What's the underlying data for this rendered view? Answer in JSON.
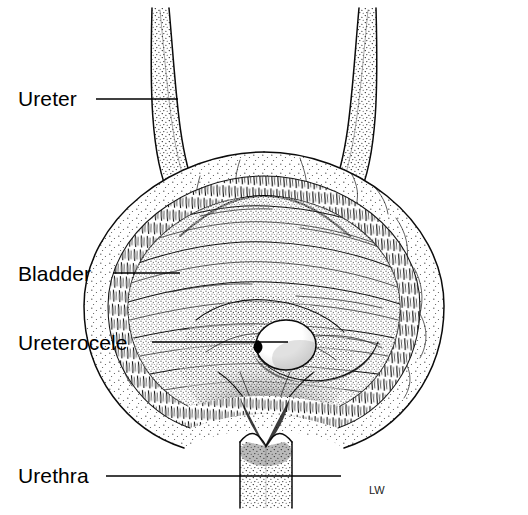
{
  "figure": {
    "kind": "line-drawing-anatomical-illustration",
    "background_color": "#ffffff",
    "ink_color": "#000000",
    "width": 528,
    "height": 515
  },
  "labels": [
    {
      "id": "ureter",
      "text": "Ureter",
      "text_x": 18,
      "text_y": 106,
      "leader": {
        "x1": 96,
        "y1": 99,
        "x2": 178,
        "y2": 99
      }
    },
    {
      "id": "bladder",
      "text": "Bladder",
      "text_x": 18,
      "text_y": 281,
      "leader": {
        "x1": 113,
        "y1": 273,
        "x2": 180,
        "y2": 273
      }
    },
    {
      "id": "ureterocele",
      "text": "Ureterocele",
      "text_x": 18,
      "text_y": 350,
      "leader": {
        "x1": 152,
        "y1": 342,
        "x2": 288,
        "y2": 342
      }
    },
    {
      "id": "urethra",
      "text": "Urethra",
      "text_x": 18,
      "text_y": 483,
      "leader": {
        "x1": 106,
        "y1": 476,
        "x2": 341,
        "y2": 476
      }
    }
  ],
  "structures": [
    {
      "id": "left-ureter",
      "name": "Left ureter",
      "description": "Narrow stippled tube descending from upper left, curving medially to enter the bladder wall"
    },
    {
      "id": "right-ureter",
      "name": "Right ureter",
      "description": "Narrow stippled tube descending from upper right, curving medially to enter the bladder wall"
    },
    {
      "id": "bladder-outer-wall",
      "name": "Bladder outer wall",
      "description": "Stippled serosal / detrusor outer layer forming the rounded bladder silhouette"
    },
    {
      "id": "bladder-muscle-band",
      "name": "Bladder muscular band",
      "description": "Hatched ring between outer wall and mucosa"
    },
    {
      "id": "bladder-mucosa",
      "name": "Bladder mucosa",
      "description": "Inner lining with horizontal rugal folds"
    },
    {
      "id": "trigone",
      "name": "Trigone",
      "description": "Dark stippled funnel of the bladder floor converging to the bladder neck"
    },
    {
      "id": "ureterocele",
      "name": "Ureterocele",
      "description": "Rounded cystic dilation of the terminal ureter bulging into the bladder lumen at the left trigone"
    },
    {
      "id": "urethra",
      "name": "Urethra",
      "description": "Vertical stippled tube exiting the bladder neck inferiorly"
    }
  ],
  "signature": {
    "text": "LW",
    "x": 369,
    "y": 494
  }
}
